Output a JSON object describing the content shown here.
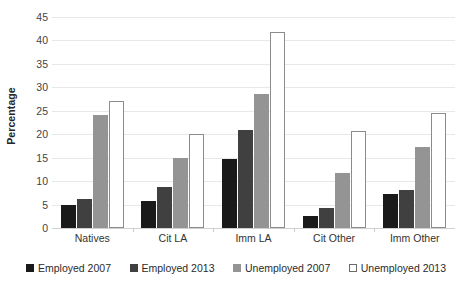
{
  "chart_data": {
    "type": "bar",
    "title": "",
    "xlabel": "",
    "ylabel": "Percentage",
    "ylim": [
      0,
      45
    ],
    "ytick_step": 5,
    "yticks": [
      0,
      5,
      10,
      15,
      20,
      25,
      30,
      35,
      40,
      45
    ],
    "grid": true,
    "legend_position": "bottom",
    "categories": [
      "Natives",
      "Cit LA",
      "Imm LA",
      "Cit Other",
      "Imm Other"
    ],
    "series": [
      {
        "name": "Employed 2007",
        "color": "#1a1a1a",
        "values": [
          5.0,
          5.8,
          14.8,
          2.5,
          7.2
        ]
      },
      {
        "name": "Employed 2013",
        "color": "#404040",
        "values": [
          6.1,
          8.8,
          20.8,
          4.3,
          8.2
        ]
      },
      {
        "name": "Unemployed 2007",
        "color": "#949494",
        "values": [
          24.0,
          15.0,
          28.5,
          11.7,
          17.3
        ]
      },
      {
        "name": "Unemployed 2013",
        "color": "#ffffff",
        "values": [
          27.0,
          20.0,
          41.8,
          20.7,
          24.5
        ]
      }
    ]
  },
  "axis": {
    "y_title": "Percentage",
    "y_tick_labels": [
      "0",
      "5",
      "10",
      "15",
      "20",
      "25",
      "30",
      "35",
      "40",
      "45"
    ],
    "x_tick_labels": [
      "Natives",
      "Cit LA",
      "Imm LA",
      "Cit Other",
      "Imm Other"
    ]
  },
  "legend": {
    "items": [
      {
        "label": "Employed 2007",
        "swatch": "filled-square-black"
      },
      {
        "label": "Employed 2013",
        "swatch": "filled-square-darkgray"
      },
      {
        "label": "Unemployed 2007",
        "swatch": "filled-square-gray"
      },
      {
        "label": "Unemployed 2013",
        "swatch": "outlined-square-white"
      }
    ]
  },
  "colors": {
    "series_employed_2007": "#1a1a1a",
    "series_employed_2013": "#404040",
    "series_unemployed_2007": "#949494",
    "series_unemployed_2013": "#ffffff",
    "gridline": "#e8e8e8",
    "background": "#ffffff"
  }
}
